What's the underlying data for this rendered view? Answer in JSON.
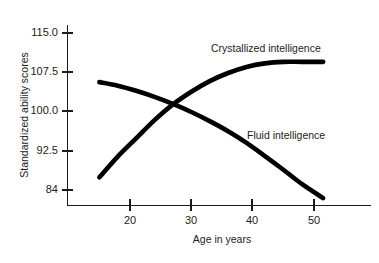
{
  "chart_data": {
    "type": "line",
    "title": "",
    "xlabel": "Age in years",
    "ylabel": "Standardized ability scores",
    "xlim": [
      12,
      56
    ],
    "ylim": [
      80.5,
      117.5
    ],
    "grid": false,
    "legend_position": "inline-annotation",
    "xticks": [
      20,
      30,
      40,
      50
    ],
    "xtick_labels": [
      "20",
      "30",
      "40",
      "50"
    ],
    "yticks": [
      84,
      92.5,
      100.0,
      107.5,
      115.0
    ],
    "ytick_labels": [
      "84",
      "92.5",
      "100.0",
      "107.5",
      "115.0"
    ],
    "series": [
      {
        "name": "Crystallized intelligence",
        "annotation": "Crystallized intelligence",
        "color": "#000000",
        "x": [
          15,
          18,
          21,
          24,
          27,
          30,
          33,
          36,
          39,
          42,
          45,
          48,
          51.5
        ],
        "values": [
          86.5,
          90.6,
          94.2,
          97.8,
          100.9,
          103.4,
          105.5,
          107.1,
          108.3,
          109.0,
          109.3,
          109.3,
          109.3
        ]
      },
      {
        "name": "Fluid intelligence",
        "annotation": "Fluid intelligence",
        "color": "#000000",
        "x": [
          15,
          18,
          21,
          24,
          27,
          30,
          33,
          36,
          39,
          42,
          45,
          48,
          51.5
        ],
        "values": [
          105.3,
          104.6,
          103.6,
          102.4,
          101.0,
          99.4,
          97.6,
          95.6,
          93.3,
          90.7,
          88.0,
          85.2,
          82.4
        ]
      }
    ],
    "crossing_point": {
      "x": 27,
      "y": 101.0
    }
  },
  "annotations": {
    "crystallized_label": "Crystallized intelligence",
    "fluid_label": "Fluid intelligence"
  },
  "axes": {
    "x_title": "Age in years",
    "y_title": "Standardized ability scores",
    "x_labels": [
      "20",
      "30",
      "40",
      "50"
    ],
    "y_labels": [
      "115.0",
      "107.5",
      "100.0",
      "92.5",
      "84"
    ]
  }
}
